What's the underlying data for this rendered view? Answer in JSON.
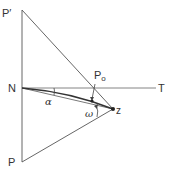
{
  "diagram": {
    "labels": {
      "p_prime": "P′",
      "n": "N",
      "t": "T",
      "p": "P",
      "z": "z",
      "p0_main": "P",
      "p0_sub": "o",
      "alpha": "α",
      "omega": "ω"
    },
    "points": {
      "P_prime": [
        22,
        10
      ],
      "N": [
        22,
        88
      ],
      "T_end": [
        156,
        88
      ],
      "P": [
        22,
        162
      ],
      "Z": [
        113,
        109
      ],
      "P0": [
        92,
        101
      ]
    },
    "stroke_color": "#555555",
    "background": "#ffffff"
  }
}
